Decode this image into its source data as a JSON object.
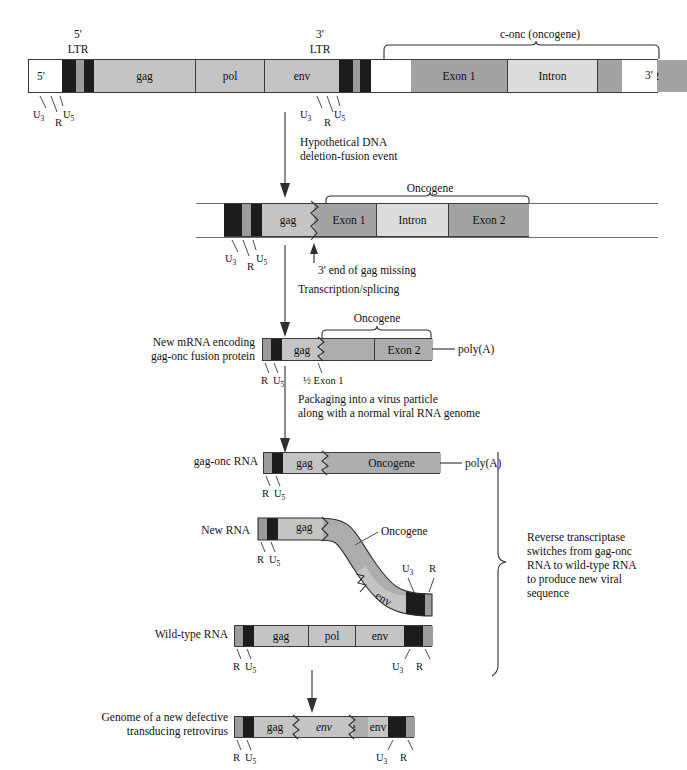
{
  "labels": {
    "five_prime": "5'",
    "three_prime": "3'",
    "ltr": "LTR",
    "u3": "U",
    "u3_sub": "3",
    "u5": "U",
    "u5_sub": "5",
    "r": "R",
    "gag": "gag",
    "pol": "pol",
    "env": "env",
    "conc": "c-onc (oncogene)",
    "conc_plain": "c-",
    "conc_italic": "onc",
    "conc_tail": " (oncogene)",
    "exon1": "Exon 1",
    "intron": "Intron",
    "exon2": "Exon 2",
    "oncogene": "Oncogene",
    "polyA": "poly(A)",
    "half_exon1": "½ Exon 1"
  },
  "row1": {
    "name": "proviral-dna-with-conc",
    "left_end_label": "5'",
    "right_end_label": "3'",
    "ltr5_label_top": "5'",
    "ltr5_label_bottom": "LTR",
    "ltr3_label_top": "3'",
    "ltr3_label_bottom": "LTR",
    "bracket_label": "c-onc (oncogene)",
    "segments": [
      {
        "label": "5'",
        "kind": "white"
      },
      {
        "label": "",
        "kind": "u3"
      },
      {
        "label": "",
        "kind": "r"
      },
      {
        "label": "",
        "kind": "u5"
      },
      {
        "label": "gag",
        "kind": "gene",
        "italic": true
      },
      {
        "label": "pol",
        "kind": "gene",
        "italic": true
      },
      {
        "label": "env",
        "kind": "gene",
        "italic": true
      },
      {
        "label": "",
        "kind": "u3"
      },
      {
        "label": "",
        "kind": "r"
      },
      {
        "label": "",
        "kind": "u5"
      },
      {
        "label": "",
        "kind": "white"
      },
      {
        "label": "Exon 1",
        "kind": "exon"
      },
      {
        "label": "Intron",
        "kind": "intron"
      },
      {
        "label": "Exon 2",
        "kind": "exon"
      },
      {
        "label": "3'",
        "kind": "white"
      }
    ]
  },
  "arrow1": {
    "name": "deletion-fusion-arrow",
    "caption_line1": "Hypothetical DNA",
    "caption_line2": "deletion-fusion event"
  },
  "row2": {
    "name": "fused-dna",
    "bracket_label": "Oncogene",
    "note": "3' end of gag missing",
    "note_prefix": "3' end of ",
    "note_italic": "gag",
    "note_suffix": " missing",
    "segments": [
      {
        "label": "",
        "kind": "u3"
      },
      {
        "label": "",
        "kind": "r"
      },
      {
        "label": "",
        "kind": "u5"
      },
      {
        "label": "gag",
        "kind": "gene",
        "italic": true
      },
      {
        "label": "Exon 1",
        "kind": "exon"
      },
      {
        "label": "Intron",
        "kind": "intron"
      },
      {
        "label": "Exon 2",
        "kind": "exon"
      }
    ]
  },
  "arrow2": {
    "name": "transcription-splicing-arrow",
    "caption": "Transcription/splicing"
  },
  "row3": {
    "name": "new-mrna",
    "left_label_line1": "New mRNA encoding",
    "left_label_line2_italic": "gag-onc",
    "left_label_line2_rest": " fusion protein",
    "bracket_label": "Oncogene",
    "tail_label": "poly(A)",
    "tick_label": "½ Exon 1",
    "segments": [
      {
        "label": "",
        "kind": "r"
      },
      {
        "label": "",
        "kind": "u5"
      },
      {
        "label": "gag",
        "kind": "gene",
        "italic": true
      },
      {
        "label": "",
        "kind": "onc"
      },
      {
        "label": "Exon 2",
        "kind": "onc"
      }
    ]
  },
  "arrow3": {
    "name": "packaging-arrow",
    "caption_line1": "Packaging into a virus particle",
    "caption_line2": "along with a normal viral RNA genome"
  },
  "row4": {
    "name": "gag-onc-rna",
    "left_label_italic": "gag-onc",
    "left_label_rest": " RNA",
    "tail_label": "poly(A)",
    "segments": [
      {
        "label": "",
        "kind": "r"
      },
      {
        "label": "",
        "kind": "u5"
      },
      {
        "label": "gag",
        "kind": "gene",
        "italic": true
      },
      {
        "label": "Oncogene",
        "kind": "onc"
      }
    ]
  },
  "row5": {
    "name": "new-rna-curved",
    "left_label": "New RNA",
    "curve_label": "Oncogene",
    "segments": [
      {
        "label": "",
        "kind": "r"
      },
      {
        "label": "",
        "kind": "u5"
      },
      {
        "label": "gag",
        "kind": "gene",
        "italic": true
      },
      {
        "label": "Oncogene",
        "kind": "onc"
      },
      {
        "label": "env",
        "kind": "gene",
        "italic": true
      },
      {
        "label": "",
        "kind": "u3"
      },
      {
        "label": "",
        "kind": "r"
      }
    ]
  },
  "row6": {
    "name": "wild-type-rna",
    "left_label": "Wild-type RNA",
    "segments": [
      {
        "label": "",
        "kind": "r"
      },
      {
        "label": "",
        "kind": "u5"
      },
      {
        "label": "gag",
        "kind": "gene",
        "italic": true
      },
      {
        "label": "pol",
        "kind": "gene",
        "italic": true
      },
      {
        "label": "env",
        "kind": "gene",
        "italic": true
      },
      {
        "label": "",
        "kind": "u3"
      },
      {
        "label": "",
        "kind": "r"
      }
    ]
  },
  "side_note": {
    "name": "reverse-transcriptase-note",
    "line1": "Reverse transcriptase",
    "line2_a": "switches from ",
    "line2_b": "gag-onc",
    "line3": "RNA to wild-type RNA",
    "line4": "to produce new viral",
    "line5": "sequence"
  },
  "arrow4": {
    "name": "final-arrow"
  },
  "row7": {
    "name": "defective-transducing-retrovirus-genome",
    "left_label_line1": "Genome of a new defective",
    "left_label_line2": "transducing retrovirus",
    "segments": [
      {
        "label": "",
        "kind": "r"
      },
      {
        "label": "",
        "kind": "u5"
      },
      {
        "label": "gag",
        "kind": "gene",
        "italic": true
      },
      {
        "label": "Oncogene",
        "kind": "onc"
      },
      {
        "label": "env",
        "kind": "gene",
        "italic": true
      },
      {
        "label": "",
        "kind": "u3"
      },
      {
        "label": "",
        "kind": "r"
      }
    ]
  },
  "colors": {
    "u3": "#1c1c1c",
    "r": "#9b9b9b",
    "u5": "#1c1c1c",
    "gene": "#c4c4c4",
    "exon": "#a3a3a3",
    "intron": "#dcdcdc",
    "oncogene": "#adadad",
    "outline": "#3a3a3a",
    "text": "#111111"
  }
}
